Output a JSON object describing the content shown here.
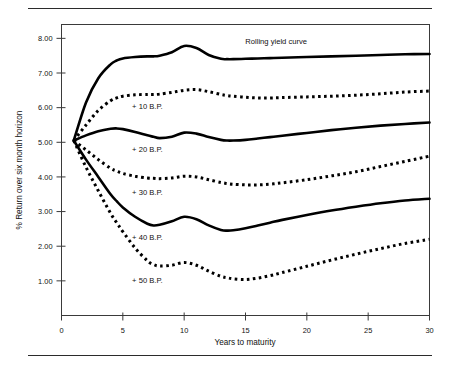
{
  "figure": {
    "background_color": "#ffffff",
    "ink_color": "#000000",
    "has_top_rule": true,
    "has_bottom_rule": true
  },
  "chart_data": {
    "type": "line",
    "title": "",
    "xlabel": "Years to maturity",
    "ylabel": "% Return over six month horizon",
    "xlim": [
      0,
      30
    ],
    "ylim": [
      0,
      8.4
    ],
    "xticks": [
      "0",
      "5",
      "10",
      "15",
      "20",
      "25",
      "30"
    ],
    "xtick_values": [
      0,
      5,
      10,
      15,
      20,
      25,
      30
    ],
    "yticks": [
      "1.00",
      "2.00",
      "3.00",
      "4.00",
      "5.00",
      "6.00",
      "7.00",
      "8.00"
    ],
    "ytick_values": [
      1,
      2,
      3,
      4,
      5,
      6,
      7,
      8
    ],
    "grid": false,
    "legend_position": "inline-annotations",
    "x": [
      1,
      2,
      3,
      4,
      4.5,
      5,
      6,
      7,
      7.5,
      8,
      9,
      10,
      11,
      12,
      13,
      13.5,
      14,
      15,
      16,
      17,
      18,
      20,
      22,
      24,
      26,
      28,
      30
    ],
    "series": [
      {
        "name": "Rolling yield curve",
        "label": "Rolling yield curve",
        "style": "solid",
        "color": "#000000",
        "values": [
          5.05,
          6.15,
          6.85,
          7.25,
          7.36,
          7.42,
          7.46,
          7.48,
          7.48,
          7.5,
          7.6,
          7.78,
          7.72,
          7.52,
          7.41,
          7.4,
          7.4,
          7.41,
          7.42,
          7.43,
          7.44,
          7.46,
          7.48,
          7.5,
          7.52,
          7.54,
          7.55
        ]
      },
      {
        "name": "+ 10 B.P.",
        "label": "+ 10 B.P.",
        "style": "dotted",
        "color": "#000000",
        "values": [
          5.05,
          5.5,
          5.92,
          6.2,
          6.28,
          6.33,
          6.37,
          6.38,
          6.38,
          6.39,
          6.44,
          6.5,
          6.52,
          6.46,
          6.38,
          6.35,
          6.33,
          6.3,
          6.28,
          6.28,
          6.29,
          6.31,
          6.33,
          6.36,
          6.4,
          6.45,
          6.48
        ]
      },
      {
        "name": "+ 20 B.P.",
        "label": "+ 20 B.P.",
        "style": "solid",
        "color": "#000000",
        "values": [
          5.05,
          5.2,
          5.32,
          5.39,
          5.4,
          5.38,
          5.3,
          5.2,
          5.16,
          5.12,
          5.16,
          5.28,
          5.25,
          5.15,
          5.07,
          5.05,
          5.05,
          5.07,
          5.11,
          5.15,
          5.19,
          5.27,
          5.35,
          5.42,
          5.48,
          5.53,
          5.57
        ]
      },
      {
        "name": "+ 30 B.P.",
        "label": "+ 30 B.P.",
        "style": "dotted",
        "color": "#000000",
        "values": [
          5.05,
          4.78,
          4.5,
          4.25,
          4.17,
          4.1,
          4.02,
          3.97,
          3.96,
          3.95,
          3.97,
          4.02,
          4.0,
          3.92,
          3.84,
          3.81,
          3.79,
          3.77,
          3.77,
          3.79,
          3.83,
          3.92,
          4.03,
          4.15,
          4.3,
          4.45,
          4.6
        ]
      },
      {
        "name": "+ 40 B.P.",
        "label": "+ 40 B.P.",
        "style": "solid",
        "color": "#000000",
        "values": [
          5.05,
          4.5,
          4.0,
          3.5,
          3.3,
          3.12,
          2.85,
          2.65,
          2.6,
          2.62,
          2.72,
          2.85,
          2.78,
          2.6,
          2.47,
          2.45,
          2.46,
          2.52,
          2.6,
          2.68,
          2.76,
          2.9,
          3.03,
          3.14,
          3.24,
          3.32,
          3.37
        ]
      },
      {
        "name": "+ 50 B.P.",
        "label": "+ 50 B.P.",
        "style": "dotted",
        "color": "#000000",
        "values": [
          5.05,
          4.28,
          3.6,
          2.95,
          2.68,
          2.42,
          1.95,
          1.58,
          1.47,
          1.43,
          1.45,
          1.53,
          1.45,
          1.28,
          1.13,
          1.09,
          1.06,
          1.04,
          1.08,
          1.15,
          1.24,
          1.42,
          1.6,
          1.77,
          1.93,
          2.08,
          2.2
        ]
      }
    ],
    "annotations": [
      {
        "text": "Rolling yield curve",
        "x": 17.5,
        "y": 7.85
      },
      {
        "text": "+ 10 B.P.",
        "x": 7.0,
        "y": 5.95
      },
      {
        "text": "+ 20 B.P.",
        "x": 7.0,
        "y": 4.72
      },
      {
        "text": "+ 30 B.P.",
        "x": 7.0,
        "y": 3.48
      },
      {
        "text": "+ 40 B.P.",
        "x": 7.0,
        "y": 2.18
      },
      {
        "text": "+ 50 B.P.",
        "x": 7.0,
        "y": 0.95
      }
    ]
  }
}
